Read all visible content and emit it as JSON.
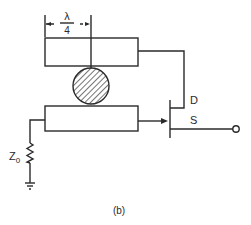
{
  "diagram": {
    "caption": "(b)",
    "dimension": {
      "numerator": "λ",
      "denominator": "4"
    },
    "transistor": {
      "drain_label": "D",
      "source_label": "S"
    },
    "resistor": {
      "label_main": "Z",
      "label_sub": "0"
    },
    "components": [
      "upper-microstrip-line",
      "dielectric-resonator",
      "lower-microstrip-line",
      "fet-transistor",
      "termination-resistor",
      "ground",
      "output-terminal"
    ],
    "colors": {
      "line": "#2a2a2a",
      "background": "#ffffff"
    }
  }
}
